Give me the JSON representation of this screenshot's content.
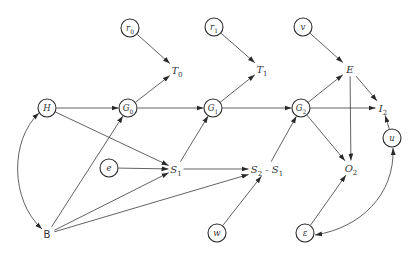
{
  "diagram": {
    "type": "path-diagram",
    "colors": {
      "line": "#3a3a3a",
      "background": "#ffffff"
    },
    "nodes": [
      {
        "id": "r0",
        "label": "r",
        "sub": "0",
        "shape": "circle",
        "x": 130,
        "y": 28
      },
      {
        "id": "r1",
        "label": "r",
        "sub": "1",
        "shape": "circle",
        "x": 214,
        "y": 27
      },
      {
        "id": "v",
        "label": "v",
        "sub": "",
        "shape": "circle",
        "x": 303,
        "y": 27
      },
      {
        "id": "T0",
        "label": "T",
        "sub": "0",
        "shape": "text",
        "x": 177,
        "y": 70
      },
      {
        "id": "T1",
        "label": "T",
        "sub": "1",
        "shape": "text",
        "x": 262,
        "y": 69
      },
      {
        "id": "E",
        "label": "E",
        "sub": "",
        "shape": "text",
        "x": 350,
        "y": 69
      },
      {
        "id": "H",
        "label": "H",
        "sub": "",
        "shape": "circle",
        "x": 47,
        "y": 108
      },
      {
        "id": "G0",
        "label": "G",
        "sub": "0",
        "shape": "circle",
        "x": 128,
        "y": 108
      },
      {
        "id": "G1",
        "label": "G",
        "sub": "1",
        "shape": "circle",
        "x": 213,
        "y": 108
      },
      {
        "id": "G2",
        "label": "G",
        "sub": "2",
        "shape": "circle",
        "x": 301,
        "y": 108
      },
      {
        "id": "I2",
        "label": "I",
        "sub": "2",
        "shape": "text",
        "x": 383,
        "y": 108
      },
      {
        "id": "u",
        "label": "u",
        "sub": "",
        "shape": "circle",
        "x": 392,
        "y": 138
      },
      {
        "id": "e",
        "label": "e",
        "sub": "",
        "shape": "circle",
        "x": 109,
        "y": 168
      },
      {
        "id": "S1",
        "label": "S",
        "sub": "1",
        "shape": "text",
        "x": 176,
        "y": 169
      },
      {
        "id": "S2S1",
        "label": "S",
        "sub": "2",
        "suffix": " - S",
        "suffix_sub": "1",
        "shape": "text",
        "x": 267,
        "y": 169
      },
      {
        "id": "O2",
        "label": "O",
        "sub": "2",
        "shape": "text",
        "x": 351,
        "y": 168
      },
      {
        "id": "B",
        "label": "B",
        "sub": "",
        "shape": "text",
        "x": 47,
        "y": 234
      },
      {
        "id": "w",
        "label": "w",
        "sub": "",
        "shape": "circle",
        "x": 217,
        "y": 233
      },
      {
        "id": "eps",
        "label": "ε",
        "sub": "",
        "shape": "circle",
        "x": 305,
        "y": 233
      }
    ],
    "edges": [
      {
        "from": "r0",
        "to": "T0"
      },
      {
        "from": "G0",
        "to": "T0"
      },
      {
        "from": "r1",
        "to": "T1"
      },
      {
        "from": "G1",
        "to": "T1"
      },
      {
        "from": "v",
        "to": "E"
      },
      {
        "from": "G2",
        "to": "E"
      },
      {
        "from": "H",
        "to": "G0"
      },
      {
        "from": "G0",
        "to": "G1"
      },
      {
        "from": "G1",
        "to": "G2"
      },
      {
        "from": "G2",
        "to": "I2"
      },
      {
        "from": "E",
        "to": "I2"
      },
      {
        "from": "u",
        "to": "I2"
      },
      {
        "from": "E",
        "to": "O2"
      },
      {
        "from": "G2",
        "to": "O2"
      },
      {
        "from": "eps",
        "to": "O2"
      },
      {
        "from": "H",
        "to": "S1"
      },
      {
        "from": "e",
        "to": "S1"
      },
      {
        "from": "S1",
        "to": "G1"
      },
      {
        "from": "S1",
        "to": "S2S1"
      },
      {
        "from": "S2S1",
        "to": "G2"
      },
      {
        "from": "w",
        "to": "S2S1"
      },
      {
        "from": "B",
        "to": "G0"
      },
      {
        "from": "B",
        "to": "S1"
      },
      {
        "from": "B",
        "to": "S2S1"
      },
      {
        "from": "H",
        "to": "B",
        "curved": true,
        "bidirectional": true
      },
      {
        "from": "eps",
        "to": "u",
        "curved": true,
        "bidirectional": true
      }
    ]
  }
}
